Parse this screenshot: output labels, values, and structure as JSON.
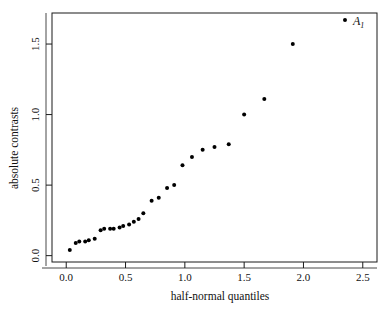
{
  "chart_data": {
    "type": "scatter",
    "title": "",
    "xlabel": "half-normal quantiles",
    "ylabel": "absolute contrasts",
    "xlim": [
      -0.12,
      2.62
    ],
    "ylim": [
      -0.045,
      1.72
    ],
    "xticks": [
      0.0,
      0.5,
      1.0,
      1.5,
      2.0,
      2.5
    ],
    "xtick_labels": [
      "0.0",
      "0.5",
      "1.0",
      "1.5",
      "2.0",
      "2.5"
    ],
    "yticks": [
      0.0,
      0.5,
      1.0,
      1.5
    ],
    "ytick_labels": [
      "0.0",
      "0.5",
      "1.0",
      "1.5"
    ],
    "grid": false,
    "legend": null,
    "frame": true,
    "point_color": "#000000",
    "point_size": 2.0,
    "x": [
      0.03,
      0.08,
      0.11,
      0.16,
      0.19,
      0.24,
      0.29,
      0.32,
      0.37,
      0.4,
      0.45,
      0.48,
      0.53,
      0.57,
      0.61,
      0.65,
      0.72,
      0.78,
      0.85,
      0.91,
      0.98,
      1.06,
      1.15,
      1.25,
      1.37,
      1.5,
      1.67,
      1.91,
      2.35
    ],
    "y": [
      0.04,
      0.09,
      0.1,
      0.1,
      0.11,
      0.12,
      0.18,
      0.19,
      0.19,
      0.19,
      0.2,
      0.21,
      0.22,
      0.24,
      0.26,
      0.3,
      0.39,
      0.41,
      0.48,
      0.5,
      0.64,
      0.7,
      0.75,
      0.77,
      0.79,
      1.0,
      1.11,
      1.5,
      1.67
    ],
    "annotations": [
      {
        "label": "A",
        "subscript": "1",
        "x": 2.35,
        "y": 1.67
      }
    ]
  }
}
